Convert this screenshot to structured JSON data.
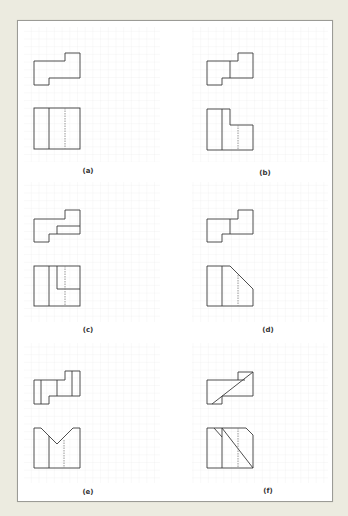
{
  "colors": {
    "page_bg": "#ecebe0",
    "panel_bg": "#ffffff",
    "grid": "#ebebeb",
    "grid_major": "#dedede",
    "line": "#3a3a3a",
    "hidden_line": "#8a8a8a"
  },
  "figures": [
    {
      "id": "a",
      "label": "(a)"
    },
    {
      "id": "b",
      "label": "(b)"
    },
    {
      "id": "c",
      "label": "(c)"
    },
    {
      "id": "d",
      "label": "(d)"
    },
    {
      "id": "e",
      "label": "(e)"
    },
    {
      "id": "f",
      "label": "(f)"
    }
  ]
}
